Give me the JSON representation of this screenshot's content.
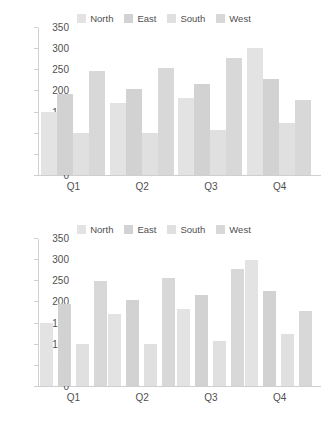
{
  "chart_data": [
    {
      "id": "top",
      "type": "bar",
      "title": "",
      "subtitle": "",
      "xlabel": "",
      "ylabel": "",
      "categories": [
        "Q1",
        "Q2",
        "Q3",
        "Q4"
      ],
      "series": [
        {
          "name": "North",
          "color": "#e3e3e3",
          "values": [
            149,
            171,
            184,
            303
          ]
        },
        {
          "name": "East",
          "color": "#d2d2d2",
          "values": [
            194,
            205,
            216,
            228
          ]
        },
        {
          "name": "South",
          "color": "#e0e0e0",
          "values": [
            99,
            101,
            108,
            123
          ]
        },
        {
          "name": "West",
          "color": "#d8d8d8",
          "values": [
            248,
            255,
            279,
            179
          ]
        }
      ],
      "ylim": [
        0,
        350
      ],
      "yticks": [
        0,
        50,
        100,
        150,
        200,
        250,
        300,
        350
      ],
      "ytick_labels": [
        "0",
        "50",
        "100",
        "150",
        "200",
        "250",
        "300",
        "350"
      ],
      "grid": false,
      "legend_position": "top-center",
      "bar_style": "touching"
    },
    {
      "id": "bottom",
      "type": "bar",
      "title": "",
      "subtitle": "",
      "xlabel": "",
      "ylabel": "",
      "categories": [
        "Q1",
        "Q2",
        "Q3",
        "Q4"
      ],
      "series": [
        {
          "name": "North",
          "color": "#e3e3e3",
          "values": [
            150,
            171,
            184,
            301
          ]
        },
        {
          "name": "East",
          "color": "#d2d2d2",
          "values": [
            195,
            205,
            216,
            227
          ]
        },
        {
          "name": "South",
          "color": "#e0e0e0",
          "values": [
            99,
            101,
            108,
            124
          ]
        },
        {
          "name": "West",
          "color": "#d8d8d8",
          "values": [
            249,
            256,
            279,
            179
          ]
        }
      ],
      "ylim": [
        0,
        350
      ],
      "yticks": [
        0,
        50,
        100,
        150,
        200,
        250,
        300,
        350
      ],
      "ytick_labels": [
        "0",
        "50",
        "100",
        "150",
        "200",
        "250",
        "300",
        "350"
      ],
      "grid": false,
      "legend_position": "top-center",
      "bar_style": "spaced"
    }
  ],
  "colors": {
    "axis": "#cfcfcf",
    "text": "#4f4f4f",
    "background": "#ffffff"
  }
}
